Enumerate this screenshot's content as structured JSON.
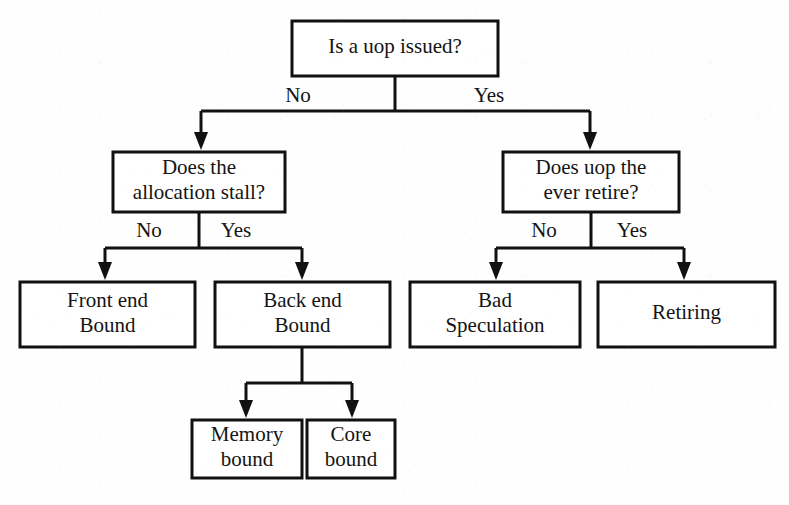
{
  "diagram": {
    "type": "decision-tree",
    "background_color": "#fefefe",
    "line_color": "#111111",
    "text_color": "#141414",
    "nodes": [
      {
        "id": "root",
        "name": "is-uop-issued",
        "kind": "decision",
        "lines": [
          "Is a uop issued?"
        ],
        "x": 292,
        "y": 21,
        "w": 206,
        "h": 55
      },
      {
        "id": "alloc",
        "name": "does-allocation-stall",
        "kind": "decision",
        "lines": [
          "Does the",
          "allocation stall?"
        ],
        "x": 113,
        "y": 152,
        "w": 172,
        "h": 60
      },
      {
        "id": "retire",
        "name": "does-uop-ever-retire",
        "kind": "decision",
        "lines": [
          "Does uop the",
          "ever retire?"
        ],
        "x": 503,
        "y": 152,
        "w": 176,
        "h": 60
      },
      {
        "id": "frontend",
        "name": "front-end-bound",
        "kind": "leaf",
        "lines": [
          "Front end",
          "Bound"
        ],
        "x": 20,
        "y": 282,
        "w": 175,
        "h": 65
      },
      {
        "id": "backend",
        "name": "back-end-bound",
        "kind": "leaf",
        "lines": [
          "Back end",
          "Bound"
        ],
        "x": 215,
        "y": 282,
        "w": 175,
        "h": 65
      },
      {
        "id": "badspec",
        "name": "bad-speculation",
        "kind": "leaf",
        "lines": [
          "Bad",
          "Speculation"
        ],
        "x": 410,
        "y": 282,
        "w": 170,
        "h": 65
      },
      {
        "id": "retiring",
        "name": "retiring",
        "kind": "leaf",
        "lines": [
          "Retiring"
        ],
        "x": 598,
        "y": 282,
        "w": 177,
        "h": 65
      },
      {
        "id": "membound",
        "name": "memory-bound",
        "kind": "leaf",
        "lines": [
          "Memory",
          "bound"
        ],
        "x": 192,
        "y": 420,
        "w": 110,
        "h": 58
      },
      {
        "id": "corebound",
        "name": "core-bound",
        "kind": "leaf",
        "lines": [
          "Core",
          "bound"
        ],
        "x": 307,
        "y": 420,
        "w": 88,
        "h": 58
      }
    ],
    "edge_labels": [
      {
        "id": "root-no",
        "name": "edge-label-root-no",
        "text": "No",
        "x": 298,
        "y": 97
      },
      {
        "id": "root-yes",
        "name": "edge-label-root-yes",
        "text": "Yes",
        "x": 489,
        "y": 97
      },
      {
        "id": "alloc-no",
        "name": "edge-label-alloc-no",
        "text": "No",
        "x": 149,
        "y": 232
      },
      {
        "id": "alloc-yes",
        "name": "edge-label-alloc-yes",
        "text": "Yes",
        "x": 236,
        "y": 232
      },
      {
        "id": "retire-no",
        "name": "edge-label-retire-no",
        "text": "No",
        "x": 544,
        "y": 232
      },
      {
        "id": "retire-yes",
        "name": "edge-label-retire-yes",
        "text": "Yes",
        "x": 632,
        "y": 232
      }
    ],
    "connectors": [
      {
        "id": "root-split",
        "name": "connector-root-split",
        "from": "root",
        "to": [
          "alloc",
          "retire"
        ],
        "stem_x": 395,
        "stem_y1": 76,
        "stem_y2": 111,
        "bar_y": 111,
        "bar_x1": 201,
        "bar_x2": 590,
        "drops": [
          {
            "x": 201,
            "y1": 111,
            "y2": 150
          },
          {
            "x": 590,
            "y1": 111,
            "y2": 150
          }
        ]
      },
      {
        "id": "alloc-split",
        "name": "connector-alloc-split",
        "from": "alloc",
        "to": [
          "frontend",
          "backend"
        ],
        "stem_x": 199,
        "stem_y1": 212,
        "stem_y2": 248,
        "bar_y": 248,
        "bar_x1": 105,
        "bar_x2": 302,
        "drops": [
          {
            "x": 105,
            "y1": 248,
            "y2": 280
          },
          {
            "x": 302,
            "y1": 248,
            "y2": 280
          }
        ]
      },
      {
        "id": "retire-split",
        "name": "connector-retire-split",
        "from": "retire",
        "to": [
          "badspec",
          "retiring"
        ],
        "stem_x": 591,
        "stem_y1": 212,
        "stem_y2": 248,
        "bar_y": 248,
        "bar_x1": 496,
        "bar_x2": 684,
        "drops": [
          {
            "x": 496,
            "y1": 248,
            "y2": 280
          },
          {
            "x": 684,
            "y1": 248,
            "y2": 280
          }
        ]
      },
      {
        "id": "backend-split",
        "name": "connector-backend-split",
        "from": "backend",
        "to": [
          "membound",
          "corebound"
        ],
        "stem_x": 302,
        "stem_y1": 347,
        "stem_y2": 383,
        "bar_y": 383,
        "bar_x1": 246,
        "bar_x2": 352,
        "drops": [
          {
            "x": 246,
            "y1": 383,
            "y2": 418
          },
          {
            "x": 352,
            "y1": 383,
            "y2": 418
          }
        ]
      }
    ],
    "arrow": {
      "half_width": 7,
      "length": 18
    }
  }
}
